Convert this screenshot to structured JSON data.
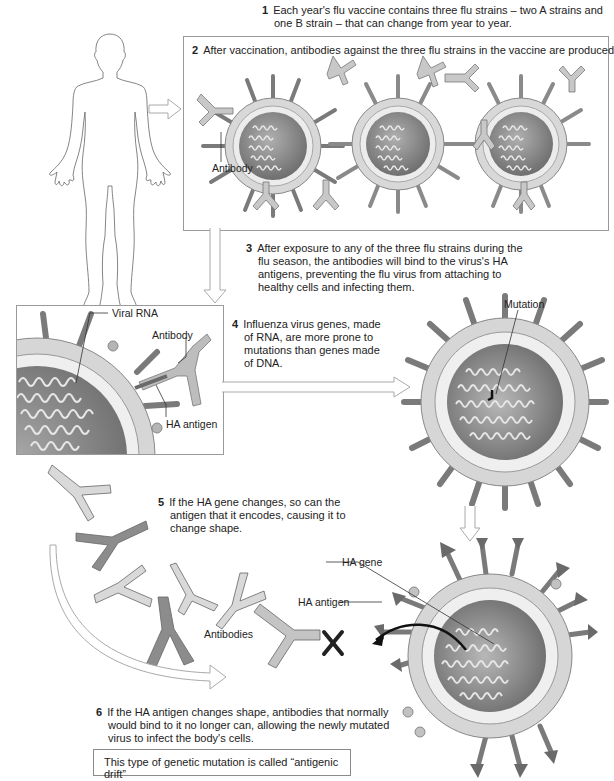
{
  "figure": {
    "steps": [
      {
        "num": "1",
        "text": "Each year's flu vaccine contains three flu strains – two A strains and one B strain – that can change from year to year."
      },
      {
        "num": "2",
        "text": "After vaccination, antibodies against the three flu strains in the vaccine are produced"
      },
      {
        "num": "3",
        "text": "After exposure to any of the three flu strains during the flu season, the antibodies will bind to the virus's HA antigens, preventing the flu virus from attaching to healthy cells and infecting them."
      },
      {
        "num": "4",
        "text": "Influenza virus genes, made of RNA, are more prone to mutations than genes made of DNA."
      },
      {
        "num": "5",
        "text": "If the HA gene changes, so can the antigen that it encodes, causing it to change shape."
      },
      {
        "num": "6",
        "text": "If the HA antigen changes shape, antibodies that normally would bind to it no longer can, allowing the newly mutated virus to infect the body's cells."
      }
    ],
    "labels": {
      "antibody_panel2": "Antibody",
      "viral_rna": "Viral RNA",
      "antibody_zoom": "Antibody",
      "ha_antigen_zoom": "HA antigen",
      "mutation": "Mutation",
      "ha_gene": "HA gene",
      "ha_antigen_mutated": "HA antigen",
      "antibodies": "Antibodies"
    },
    "callout": "This type of genetic mutation is called “antigenic drift”",
    "colors": {
      "core_dark": "#6f6f6f",
      "core_mid": "#9a9a9a",
      "envelope": "#d6d6d6",
      "antibody_light": "#d9d9d9",
      "antibody_dark": "#8c8c8c",
      "spike": "#8a8a8a",
      "arrow_outline": "#b0b0b0"
    }
  }
}
